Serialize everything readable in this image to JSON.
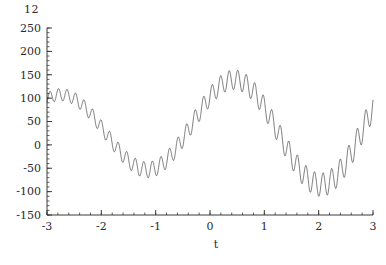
{
  "figure": {
    "number_label": "12",
    "background": "#ffffff",
    "curve_color": "#111111",
    "axis_color": "#3a3a3a"
  },
  "chart_data": {
    "type": "line",
    "title": "",
    "subtitle": "",
    "xlabel": "t",
    "ylabel": "",
    "grid": false,
    "legend": null,
    "xlim": [
      -3,
      3
    ],
    "ylim": [
      -150,
      250
    ],
    "xticks": [
      -3,
      -2,
      -1,
      0,
      1,
      2,
      3
    ],
    "xtick_labels": [
      "-3",
      "-2",
      "-1",
      "0",
      "1",
      "2",
      "3"
    ],
    "yticks": [
      -150,
      -100,
      -50,
      0,
      50,
      100,
      150,
      200,
      250
    ],
    "ytick_labels": [
      "-150",
      "-100",
      "-50",
      "0",
      "50",
      "100",
      "150",
      "200",
      "250"
    ],
    "x_minor_tick_step": 0.2,
    "y_minor_tick_step": 10,
    "series": [
      {
        "name": "modulated signal",
        "carrier_amplitude_base": 100,
        "carrier_amplitude_growth": 10,
        "carrier_period": 3.2,
        "carrier_phase": 0.75,
        "carrier_offset": 35,
        "ripple_amplitude_base": 20,
        "ripple_amplitude_growth": 2.5,
        "ripple_frequency": 40,
        "samples": 2400
      }
    ],
    "annotations": [
      {
        "text": "first peak",
        "x": -2.3,
        "y": 140,
        "band": [
          110,
          162
        ]
      },
      {
        "text": "first trough",
        "x": -0.85,
        "y": -60,
        "band": [
          -82,
          -38
        ]
      },
      {
        "text": "second peak",
        "x": 0.8,
        "y": 155,
        "band": [
          128,
          182
        ]
      },
      {
        "text": "second trough",
        "x": 2.35,
        "y": -88,
        "band": [
          -112,
          -62
        ]
      },
      {
        "text": "left endpoint",
        "x": -3,
        "y": 42,
        "band": [
          24,
          60
        ]
      },
      {
        "text": "right endpoint",
        "x": 3,
        "y": -22,
        "band": [
          -40,
          -5
        ]
      }
    ]
  }
}
